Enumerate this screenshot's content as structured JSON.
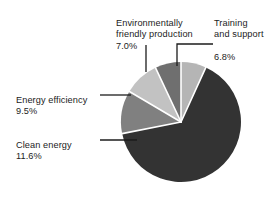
{
  "chart_data": {
    "type": "pie",
    "title": "",
    "subtitle": "",
    "xlabel": "",
    "ylabel": "",
    "legend_position": "none",
    "grid": false,
    "start_angle_deg": 0,
    "direction": "clockwise",
    "units": "percent",
    "categories": [
      "Training and support",
      "Environmentally friendly production",
      "Energy efficiency",
      "Clean energy",
      "Unlabeled major segment"
    ],
    "values": [
      6.8,
      7.0,
      9.5,
      11.6,
      65.1
    ],
    "colors": [
      "#b5b5b5",
      "#6f6f6f",
      "#c2c2c2",
      "#808080",
      "#333333"
    ],
    "slices": [
      {
        "name": "training-and-support",
        "label_line1": "Training",
        "label_line2": "and support",
        "percent_text": "6.8%",
        "value": 6.8,
        "color": "#b5b5b5",
        "labeled": true
      },
      {
        "name": "environmentally-friendly-production",
        "label_line1": "Environmentally",
        "label_line2": "friendly production",
        "percent_text": "7.0%",
        "value": 7.0,
        "color": "#6f6f6f",
        "labeled": true
      },
      {
        "name": "energy-efficiency",
        "label_line1": "Energy efficiency",
        "label_line2": "",
        "percent_text": "9.5%",
        "value": 9.5,
        "color": "#c2c2c2",
        "labeled": true
      },
      {
        "name": "clean-energy",
        "label_line1": "Clean energy",
        "label_line2": "",
        "percent_text": "11.6%",
        "value": 11.6,
        "color": "#808080",
        "labeled": true
      },
      {
        "name": "major-segment",
        "label_line1": "",
        "label_line2": "",
        "percent_text": "",
        "value": 65.1,
        "color": "#333333",
        "labeled": false
      }
    ]
  },
  "labels": {
    "environmentally_friendly": {
      "line1": "Environmentally",
      "line2": "friendly production",
      "percent": "7.0%"
    },
    "training_support": {
      "line1": "Training",
      "line2": "and support",
      "percent": "6.8%"
    },
    "energy_efficiency": {
      "line1": "Energy efficiency",
      "percent": "9.5%"
    },
    "clean_energy": {
      "line1": "Clean energy",
      "percent": "11.6%"
    }
  },
  "style": {
    "background": "#ffffff",
    "text_color": "#1c1c1c",
    "separator_color": "#ffffff",
    "leader_color": "#1c1c1c"
  }
}
